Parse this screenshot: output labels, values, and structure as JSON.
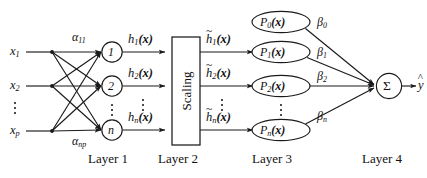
{
  "figure": {
    "background_color": "#ffffff",
    "ink_color": "#1a1a1a"
  },
  "inputs": [
    {
      "name": "x1",
      "base": "x",
      "sub": "1"
    },
    {
      "name": "x2",
      "base": "x",
      "sub": "2"
    },
    {
      "name": "xp",
      "base": "x",
      "sub": "p"
    }
  ],
  "layer1": {
    "label": "Layer 1",
    "nodes": [
      {
        "name": "node-1",
        "text": "1"
      },
      {
        "name": "node-2",
        "text": "2"
      },
      {
        "name": "node-n",
        "text": "n"
      }
    ],
    "weights": [
      {
        "name": "alpha-11",
        "base": "α",
        "sub": "11"
      },
      {
        "name": "alpha-np",
        "base": "α",
        "sub": "np"
      }
    ],
    "outputs": [
      {
        "name": "h1",
        "base": "h",
        "sub": "1",
        "arg": "(x)"
      },
      {
        "name": "h2",
        "base": "h",
        "sub": "2",
        "arg": "(x)"
      },
      {
        "name": "hn",
        "base": "h",
        "sub": "n",
        "arg": "(x)"
      }
    ]
  },
  "layer2": {
    "label": "Layer 2",
    "box_text": "Scaling",
    "outputs": [
      {
        "name": "h1-tilde",
        "tilde": "~",
        "base": "h",
        "sub": "1",
        "arg": "(x)"
      },
      {
        "name": "h2-tilde",
        "tilde": "~",
        "base": "h",
        "sub": "2",
        "arg": "(x)"
      },
      {
        "name": "hn-tilde",
        "tilde": "~",
        "base": "h",
        "sub": "n",
        "arg": "(x)"
      }
    ]
  },
  "layer3": {
    "label": "Layer 3",
    "nodes": [
      {
        "name": "P0",
        "base": "P",
        "sub": "0",
        "arg": "(x)"
      },
      {
        "name": "P1",
        "base": "P",
        "sub": "1",
        "arg": "(x)"
      },
      {
        "name": "P2",
        "base": "P",
        "sub": "2",
        "arg": "(x)"
      },
      {
        "name": "Pn",
        "base": "P",
        "sub": "n",
        "arg": "(x)"
      }
    ],
    "weights": [
      {
        "name": "beta-0",
        "base": "β",
        "sub": "0"
      },
      {
        "name": "beta-1",
        "base": "β",
        "sub": "1"
      },
      {
        "name": "beta-2",
        "base": "β",
        "sub": "2"
      },
      {
        "name": "beta-n",
        "base": "β",
        "sub": "n"
      }
    ]
  },
  "layer4": {
    "label": "Layer 4",
    "sum_symbol": "Σ",
    "output": {
      "name": "y-hat",
      "hat": "^",
      "base": "y"
    }
  },
  "ellipsis": {
    "symbol": "⋮"
  }
}
